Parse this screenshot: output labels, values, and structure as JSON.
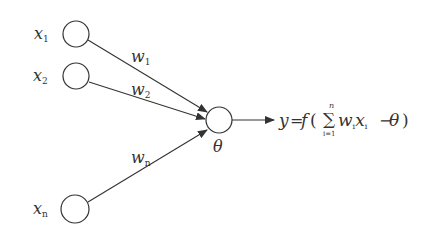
{
  "diagram": {
    "type": "perceptron-neuron-model",
    "colors": {
      "stroke": "#333333",
      "background": "#ffffff",
      "text": "#333333"
    },
    "inputs": [
      {
        "label": "x",
        "subscript": "1",
        "weight": "w",
        "weight_subscript": "1"
      },
      {
        "label": "x",
        "subscript": "2",
        "weight": "w",
        "weight_subscript": "2"
      },
      {
        "label": "x",
        "subscript": "n",
        "weight": "w",
        "weight_subscript": "n"
      }
    ],
    "neuron": {
      "threshold_label": "θ"
    },
    "output": {
      "lhs": "y",
      "equals": "=",
      "func": "f",
      "open_paren": "(",
      "sum_symbol": "∑",
      "sum_upper": "n",
      "sum_lower": "i=1",
      "term_w": "w",
      "term_w_sub": "i",
      "term_x": "x",
      "term_x_sub": "i",
      "minus": "−",
      "theta": "θ",
      "close_paren": ")"
    }
  }
}
